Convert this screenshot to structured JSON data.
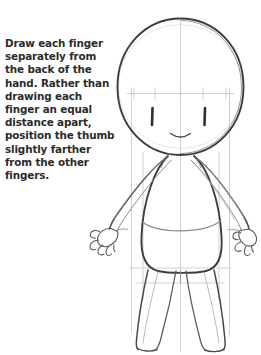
{
  "page": {
    "width": 261,
    "height": 355,
    "background_color": "#ffffff",
    "kind": "pencil-sketch-drawing-tutorial"
  },
  "instruction": {
    "text": "Draw each finger separately from the back of the hand. Rather than drawing each finger an equal distance apart, position the thumb slightly farther from the other fingers.",
    "color": "#2b2b2b"
  },
  "artwork": {
    "title": "chibi-character-construction-sketch",
    "subject": "chibi figure with large round head, bell-shaped torso, outstretched arms and sketched hands, tapering legs",
    "ink_color": "#3a3a3a",
    "guide_color": "#c9c9cf",
    "light_sketch_color": "#9a9aa2",
    "parts": {
      "head": "large-circle",
      "face_marks": "two vertical eye strokes and a small curved smile",
      "guides": "vertical centerline, horizontal eye line with tick marks, outer vertical body guides, hip guide line",
      "torso": "bell-shaped body with curved waist line",
      "arms": "two tapered arms angling down and outward",
      "hands": "two small sketched hands with separated fingers and thumb",
      "legs": "two tapering legs ending in small feet"
    }
  }
}
